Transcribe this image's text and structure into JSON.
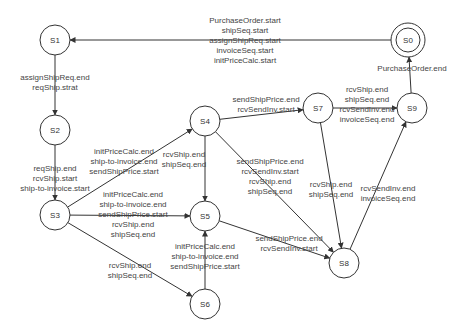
{
  "diagram": {
    "type": "state-machine",
    "nodes": [
      {
        "id": "S0",
        "label": "S0",
        "x": 408,
        "y": 40,
        "final": true
      },
      {
        "id": "S1",
        "label": "S1",
        "x": 55,
        "y": 40
      },
      {
        "id": "S2",
        "label": "S2",
        "x": 55,
        "y": 130
      },
      {
        "id": "S3",
        "label": "S3",
        "x": 55,
        "y": 215
      },
      {
        "id": "S4",
        "label": "S4",
        "x": 205,
        "y": 121
      },
      {
        "id": "S5",
        "label": "S5",
        "x": 205,
        "y": 216
      },
      {
        "id": "S6",
        "label": "S6",
        "x": 205,
        "y": 304
      },
      {
        "id": "S7",
        "label": "S7",
        "x": 318,
        "y": 108
      },
      {
        "id": "S8",
        "label": "S8",
        "x": 344,
        "y": 263
      },
      {
        "id": "S9",
        "label": "S9",
        "x": 412,
        "y": 108
      }
    ],
    "edges": [
      {
        "from": "S0",
        "to": "S1",
        "labels": [
          "PurchaseOrder.start",
          "shipSeq.start",
          "assignShipReq.start",
          "invoiceSeq.start",
          "initPriceCalc.start"
        ],
        "lx": 245,
        "ly": 16
      },
      {
        "from": "S1",
        "to": "S2",
        "labels": [
          "assignShipReq.end",
          "reqShip.strat"
        ],
        "lx": 55,
        "ly": 73
      },
      {
        "from": "S2",
        "to": "S3",
        "labels": [
          "reqShip.end",
          "rcvShip.start",
          "ship-to-invoice.start"
        ],
        "lx": 55,
        "ly": 164
      },
      {
        "from": "S3",
        "to": "S4",
        "labels": [
          "initPriceCalc.end",
          "ship-to-invoice.end",
          "sendShipPrice.start"
        ],
        "lx": 124,
        "ly": 147
      },
      {
        "from": "S3",
        "to": "S5",
        "labels": [
          "initPriceCalc.end",
          "ship-to-invoice.end",
          "sendShipPrice.start",
          "rcvShip.end",
          "shipSeq.end"
        ],
        "lx": 133,
        "ly": 190
      },
      {
        "from": "S3",
        "to": "S6",
        "labels": [
          "rcvShip.end",
          "shipSeq.end"
        ],
        "lx": 130,
        "ly": 261
      },
      {
        "from": "S4",
        "to": "S5",
        "labels": [
          "rcvShip.end",
          "shipSeq.end"
        ],
        "lx": 184,
        "ly": 150
      },
      {
        "from": "S6",
        "to": "S5",
        "labels": [
          "initPriceCalc.end",
          "ship-to-invoice.end",
          "sendShipPrice.start"
        ],
        "lx": 205,
        "ly": 242
      },
      {
        "from": "S4",
        "to": "S7",
        "labels": [
          "sendShipPrice.end",
          "rcvSendInv.start"
        ],
        "lx": 266,
        "ly": 95
      },
      {
        "from": "S4",
        "to": "S8",
        "labels": [
          "sendShipPrice.end",
          "rcvSendInv.start",
          "rcvShip.end",
          "shipSeq.end"
        ],
        "lx": 270,
        "ly": 157
      },
      {
        "from": "S5",
        "to": "S8",
        "labels": [
          "sendShipPrice.end",
          "rcvSendInv.start"
        ],
        "lx": 289,
        "ly": 234
      },
      {
        "from": "S7",
        "to": "S8",
        "labels": [
          "rcvShip.end",
          "shipSeq.end"
        ],
        "lx": 331,
        "ly": 180
      },
      {
        "from": "S7",
        "to": "S9",
        "labels": [
          "rcvShip.end",
          "shipSeq.end",
          "rcvSendInv.end",
          "invoiceSeq.end"
        ],
        "lx": 367,
        "ly": 85
      },
      {
        "from": "S8",
        "to": "S9",
        "labels": [
          "rcvSendInv.end",
          "invoiceSeq.end"
        ],
        "lx": 388,
        "ly": 184
      },
      {
        "from": "S9",
        "to": "S0",
        "labels": [
          "PurchaseOrder.end"
        ],
        "lx": 412,
        "ly": 64
      }
    ]
  }
}
